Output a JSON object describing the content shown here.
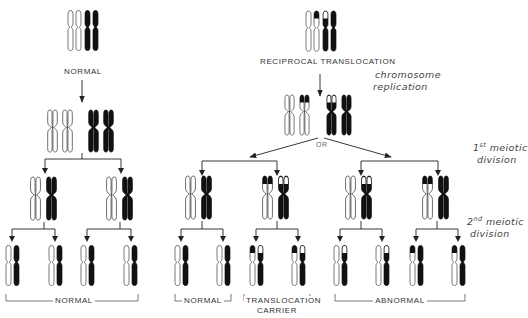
{
  "labels": {
    "normal_top": "NORMAL",
    "reciprocal_translocation": "RECIPROCAL TRANSLOCATION",
    "chromosome_replication_line1": "chromosome",
    "chromosome_replication_line2": "replication",
    "or": "OR",
    "first_meiotic_ordinal": "1",
    "first_meiotic_sup": "st",
    "first_meiotic_line1": "meiotic",
    "first_meiotic_line2": "division",
    "second_meiotic_ordinal": "2",
    "second_meiotic_sup": "nd",
    "second_meiotic_line1": "meiotic",
    "second_meiotic_line2": "division",
    "outcome_left": "NORMAL",
    "outcome_mid_normal": "NORMAL",
    "outcome_carrier_line1": "TRANSLOCATION",
    "outcome_carrier_line2": "CARRIER",
    "outcome_abnormal": "ABNORMAL"
  },
  "colors": {
    "ink": "#111111",
    "line": "#222222",
    "outline": "#333333",
    "paper": "#ffffff"
  }
}
